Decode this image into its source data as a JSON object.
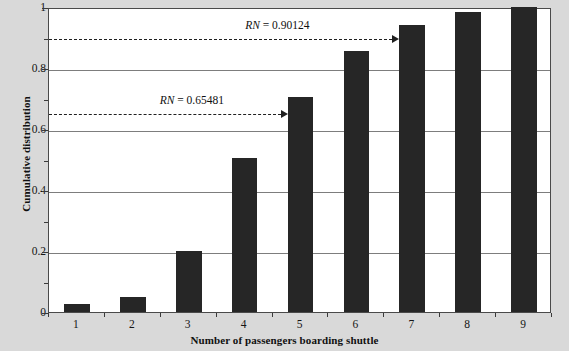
{
  "chart_data": {
    "type": "bar",
    "title": "",
    "xlabel": "Number of passengers boarding shuttle",
    "ylabel": "Cumulative distribution",
    "categories": [
      "1",
      "2",
      "3",
      "4",
      "5",
      "6",
      "7",
      "8",
      "9"
    ],
    "values": [
      0.025,
      0.05,
      0.2,
      0.505,
      0.705,
      0.855,
      0.94,
      0.985,
      1.0
    ],
    "xlim": [
      0.5,
      9.5
    ],
    "ylim": [
      0,
      1
    ],
    "y_ticks": [
      "0",
      "0.2",
      "0.4",
      "0.6",
      "0.8",
      "1"
    ],
    "y_tick_values": [
      0,
      0.2,
      0.4,
      0.6,
      0.8,
      1
    ],
    "grid": true,
    "legend": "none",
    "bar_color": "#262626",
    "plot_background": "#ffffff",
    "figure_background": "#d9d9d9",
    "grid_color": "#7d7d7d",
    "annotations": [
      {
        "label_prefix": "RN",
        "label_rest": " = 0.90124",
        "value": 0.90124,
        "target_category": "7",
        "label_x_fraction": 0.39,
        "style": "dashed-arrow"
      },
      {
        "label_prefix": "RN",
        "label_rest": " = 0.65481",
        "value": 0.65481,
        "target_category": "5",
        "label_x_fraction": 0.22,
        "style": "dashed-arrow"
      }
    ]
  }
}
